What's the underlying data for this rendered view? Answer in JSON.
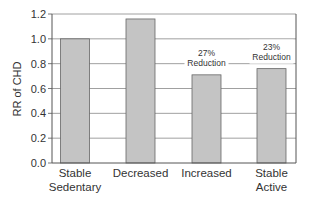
{
  "chart_data": {
    "type": "bar",
    "title": "",
    "xlabel": "",
    "ylabel": "RR of CHD",
    "ylim": [
      0,
      1.2
    ],
    "yticks": [
      "0.0",
      "0.2",
      "0.4",
      "0.6",
      "0.8",
      "1.0",
      "1.2"
    ],
    "grid": true,
    "legend": null,
    "categories": [
      [
        "Stable",
        "Sedentary"
      ],
      [
        "Decreased"
      ],
      [
        "Increased"
      ],
      [
        "Stable",
        "Active"
      ]
    ],
    "category_labels": [
      "Stable Sedentary",
      "Decreased",
      "Increased",
      "Stable Active"
    ],
    "values": [
      1.0,
      1.16,
      0.71,
      0.76
    ],
    "annotations": [
      null,
      null,
      [
        "27%",
        "Reduction"
      ],
      [
        "23%",
        "Reduction"
      ]
    ],
    "colors": {
      "bar": "#c4c4c4",
      "bar_edge": "#666666",
      "grid": "#888888",
      "axis": "#555555"
    }
  }
}
